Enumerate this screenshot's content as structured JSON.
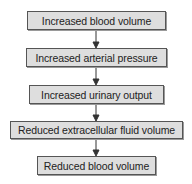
{
  "diagram": {
    "type": "flowchart",
    "direction": "top-to-bottom",
    "nodes": [
      {
        "id": "n1",
        "label": "Increased blood volume",
        "x": 27,
        "y": 11,
        "w": 139,
        "h": 19
      },
      {
        "id": "n2",
        "label": "Increased arterial pressure",
        "x": 26,
        "y": 48,
        "w": 141,
        "h": 19
      },
      {
        "id": "n3",
        "label": "Increased urinary output",
        "x": 29,
        "y": 85,
        "w": 135,
        "h": 19
      },
      {
        "id": "n4",
        "label": "Reduced extracellular fluid volume",
        "x": 10,
        "y": 121,
        "w": 173,
        "h": 18
      },
      {
        "id": "n5",
        "label": "Reduced blood volume",
        "x": 37,
        "y": 156,
        "w": 119,
        "h": 19
      }
    ],
    "edges": [
      {
        "from": "n1",
        "to": "n2"
      },
      {
        "from": "n2",
        "to": "n3"
      },
      {
        "from": "n3",
        "to": "n4"
      },
      {
        "from": "n4",
        "to": "n5"
      }
    ],
    "colors": {
      "box_fill": "#dedede",
      "box_border": "#555555",
      "arrow": "#333333"
    }
  }
}
